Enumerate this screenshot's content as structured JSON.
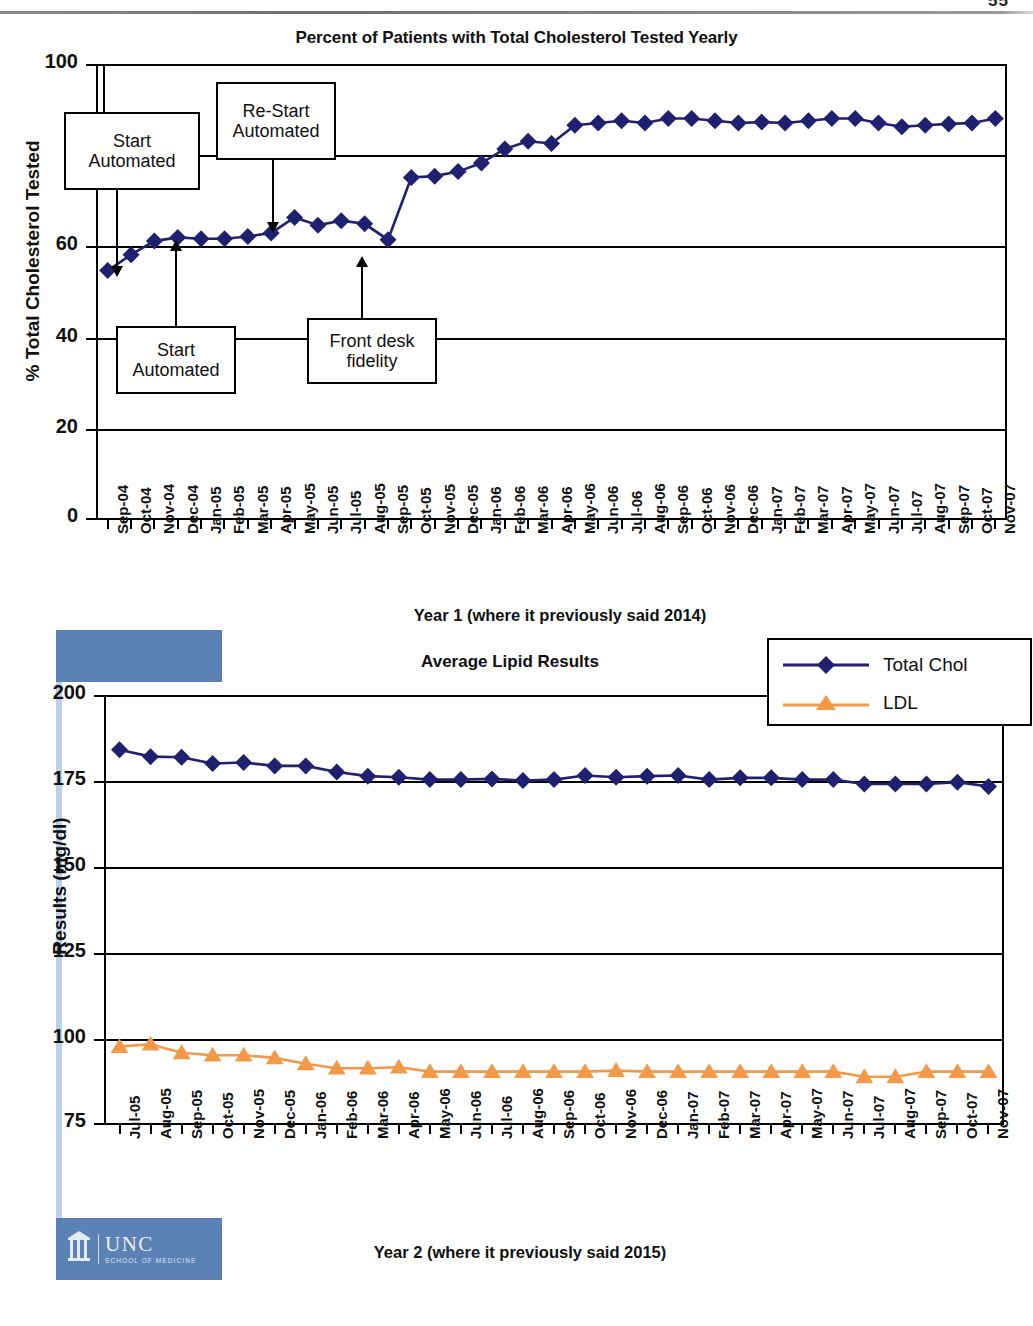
{
  "page": {
    "number": "55"
  },
  "chart_data": [
    {
      "id": "chart1",
      "type": "line",
      "title": "Percent of Patients with Total Cholesterol Tested Yearly",
      "xlabel": "Year 1 (where it previously said 2014)",
      "ylabel": "% Total Cholesterol Tested",
      "ylim": [
        0,
        100
      ],
      "yticks": [
        "0",
        "20",
        "40",
        "60",
        "8",
        "100"
      ],
      "ytickvalues": [
        0,
        20,
        40,
        60,
        80,
        100
      ],
      "grid": true,
      "legend": "none",
      "series_color": "#1f2170",
      "marker": "diamond",
      "categories": [
        "Sep-04",
        "Oct-04",
        "Nov-04",
        "Dec-04",
        "Jan-05",
        "Feb-05",
        "Mar-05",
        "Apr-05",
        "May-05",
        "Jun-05",
        "Jul-05",
        "Aug-05",
        "Sep-05",
        "Oct-05",
        "Nov-05",
        "Dec-05",
        "Jan-06",
        "Feb-06",
        "Mar-06",
        "Apr-06",
        "May-06",
        "Jun-06",
        "Jul-06",
        "Aug-06",
        "Sep-06",
        "Oct-06",
        "Nov-06",
        "Dec-06",
        "Jan-07",
        "Feb-07",
        "Mar-07",
        "Apr-07",
        "May-07",
        "Jun-07",
        "Jul-07",
        "Aug-07",
        "Sep-07",
        "Oct-07",
        "Nov-07"
      ],
      "series": [
        {
          "name": "% Total Cholesterol Tested",
          "values": [
            54.5,
            58.0,
            61.0,
            61.8,
            61.5,
            61.5,
            62.0,
            62.8,
            66.2,
            64.5,
            65.5,
            64.8,
            61.3,
            75.0,
            75.3,
            76.3,
            78.2,
            81.3,
            83.0,
            82.5,
            86.5,
            87.0,
            87.5,
            87.0,
            88.0,
            88.0,
            87.5,
            87.0,
            87.2,
            87.0,
            87.5,
            88.0,
            88.0,
            87.0,
            86.2,
            86.5,
            86.8,
            87.0,
            88.0
          ]
        }
      ],
      "annotations": [
        {
          "id": "start-automated-1",
          "lines": [
            "Start",
            "Automated"
          ],
          "target": "Sep-04"
        },
        {
          "id": "re-start-automated",
          "lines": [
            "Re-Start",
            "Automated"
          ],
          "target": "Apr-05"
        },
        {
          "id": "start-automated-2",
          "lines": [
            "Start",
            "Automated"
          ],
          "target": "Nov-04"
        },
        {
          "id": "front-desk-fidelity",
          "lines": [
            "Front desk",
            "fidelity"
          ],
          "target": "Aug-05"
        }
      ]
    },
    {
      "id": "chart2",
      "type": "line",
      "title": "Average Lipid Results",
      "xlabel": "Year 2 (where it previously said 2015)",
      "ylabel": "Results (mg/dl)",
      "ylim": [
        75,
        200
      ],
      "yticks": [
        "75",
        "100",
        "125",
        "150",
        "175",
        "200"
      ],
      "ytickvalues": [
        75,
        100,
        125,
        150,
        175,
        200
      ],
      "grid": true,
      "legend": "top-right",
      "categories": [
        "Jul-05",
        "Aug-05",
        "Sep-05",
        "Oct-05",
        "Nov-05",
        "Dec-05",
        "Jan-06",
        "Feb-06",
        "Mar-06",
        "Apr-06",
        "May-06",
        "Jun-06",
        "Jul-06",
        "Aug-06",
        "Sep-06",
        "Oct-06",
        "Nov-06",
        "Dec-06",
        "Jan-07",
        "Feb-07",
        "Mar-07",
        "Apr-07",
        "May-07",
        "Jun-07",
        "Jul-07",
        "Aug-07",
        "Sep-07",
        "Oct-07",
        "Nov-07"
      ],
      "series": [
        {
          "name": "Total Chol",
          "color": "#1f2170",
          "marker": "diamond",
          "values": [
            184.0,
            182.0,
            181.8,
            180.0,
            180.3,
            179.3,
            179.3,
            177.5,
            176.3,
            176.0,
            175.3,
            175.3,
            175.5,
            175.0,
            175.3,
            176.5,
            176.0,
            176.3,
            176.5,
            175.3,
            175.8,
            175.8,
            175.3,
            175.3,
            174.0,
            174.0,
            174.0,
            174.5,
            173.3
          ]
        },
        {
          "name": "LDL",
          "color": "#f2994a",
          "marker": "triangle",
          "values": [
            97.3,
            98.0,
            95.5,
            94.8,
            94.8,
            94.0,
            92.3,
            91.0,
            91.0,
            91.3,
            90.0,
            90.0,
            90.0,
            90.0,
            90.0,
            90.0,
            90.3,
            90.0,
            90.0,
            90.0,
            90.0,
            90.0,
            90.0,
            90.0,
            88.5,
            88.5,
            90.0,
            90.0,
            90.0
          ]
        }
      ]
    }
  ],
  "logo": {
    "name": "UNC",
    "sub": "SCHOOL OF MEDICINE"
  }
}
